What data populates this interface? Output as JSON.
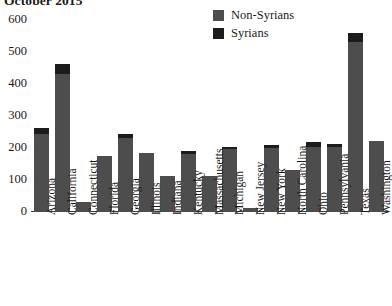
{
  "title": "October 2015",
  "legend": {
    "position": "top-right",
    "entries": [
      {
        "label": "Non-Syrians",
        "color": "#4d4d4d",
        "icon": "legend-swatch"
      },
      {
        "label": "Syrians",
        "color": "#1c1c1c",
        "icon": "legend-swatch"
      }
    ]
  },
  "chart_data": {
    "type": "bar",
    "stacked": true,
    "title": "October 2015",
    "xlabel": "",
    "ylabel": "",
    "ylim": [
      0,
      600
    ],
    "yticks": [
      0,
      100,
      200,
      300,
      400,
      500,
      600
    ],
    "grid": false,
    "legend_position": "top-right",
    "categories": [
      "Arizona",
      "California",
      "Connecticut",
      "Florida",
      "Georgia",
      "Illinois",
      "Indiana",
      "Kentucky",
      "Massachusetts",
      "Michigan",
      "New Jersey",
      "New York",
      "North Carolina",
      "Ohio",
      "Pennsylvania",
      "Texas",
      "Washington"
    ],
    "series": [
      {
        "name": "Non-Syrians",
        "color": "#4d4d4d",
        "values": [
          245,
          431,
          30,
          175,
          232,
          183,
          112,
          182,
          112,
          197,
          14,
          200,
          130,
          204,
          204,
          532,
          223
        ]
      },
      {
        "name": "Syrians",
        "color": "#1c1c1c",
        "values": [
          19,
          31,
          0,
          0,
          12,
          0,
          0,
          10,
          0,
          7,
          0,
          10,
          0,
          15,
          10,
          28,
          0
        ]
      }
    ],
    "totals": [
      264,
      462,
      30,
      175,
      244,
      183,
      112,
      192,
      112,
      204,
      14,
      210,
      130,
      219,
      214,
      560,
      223
    ]
  }
}
